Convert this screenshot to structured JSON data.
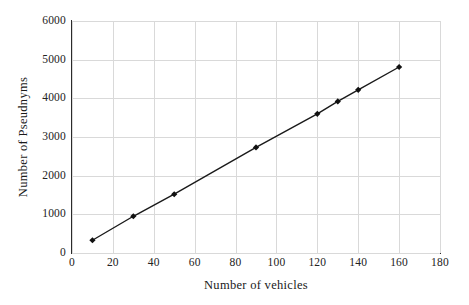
{
  "chart_data": {
    "type": "line",
    "title": "",
    "xlabel": "Number of vehicles",
    "ylabel": "Number of Pseudnyms",
    "xlim": [
      0,
      180
    ],
    "ylim": [
      0,
      6000
    ],
    "xticks": [
      0,
      20,
      40,
      60,
      80,
      100,
      120,
      140,
      160,
      180
    ],
    "yticks": [
      0,
      1000,
      2000,
      3000,
      4000,
      5000,
      6000
    ],
    "grid": true,
    "legend": null,
    "marker": "filled-diamond",
    "line_color": "#1a1a1a",
    "grid_color": "#d9d9d9",
    "axis_color": "#2b2b2b",
    "background": "#ffffff",
    "x": [
      10,
      30,
      50,
      90,
      120,
      130,
      140,
      160
    ],
    "values": [
      330,
      950,
      1520,
      2730,
      3600,
      3920,
      4220,
      4810
    ],
    "series": [
      {
        "name": "Number of Pseudnyms",
        "x": [
          10,
          30,
          50,
          90,
          120,
          130,
          140,
          160
        ],
        "values": [
          330,
          950,
          1520,
          2730,
          3600,
          3920,
          4220,
          4810
        ]
      }
    ]
  }
}
